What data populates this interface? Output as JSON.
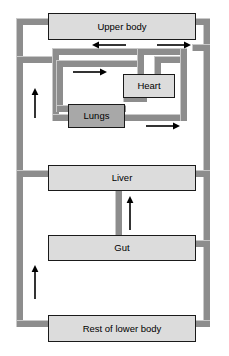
{
  "diagram": {
    "width": 229,
    "height": 356,
    "background": "#ffffff",
    "colors": {
      "vessel": "#8d8d8d",
      "vessel_highlight": "#c9c9c9",
      "organ_fill": "#dcdcdc",
      "organ_shaded_fill": "#a8a8a8",
      "organ_border": "#1a1a1a",
      "arrow": "#000000",
      "text": "#000000"
    }
  },
  "organs": [
    {
      "key": "upper_body",
      "label": "Upper body",
      "shaded": false,
      "x": 48,
      "y": 13,
      "w": 148,
      "h": 27
    },
    {
      "key": "heart",
      "label": "Heart",
      "shaded": false,
      "x": 123,
      "y": 74,
      "w": 52,
      "h": 24
    },
    {
      "key": "lungs",
      "label": "Lungs",
      "shaded": true,
      "x": 68,
      "y": 104,
      "w": 57,
      "h": 24
    },
    {
      "key": "liver",
      "label": "Liver",
      "shaded": false,
      "x": 48,
      "y": 165,
      "w": 148,
      "h": 26
    },
    {
      "key": "gut",
      "label": "Gut",
      "shaded": false,
      "x": 48,
      "y": 235,
      "w": 148,
      "h": 26
    },
    {
      "key": "rest_of_lower_body",
      "label": "Rest of lower body",
      "shaded": false,
      "x": 48,
      "y": 315,
      "w": 148,
      "h": 27
    }
  ],
  "vessels": [
    {
      "key": "left-main-trunk",
      "x": 16,
      "y": 18,
      "w": 7,
      "h": 309
    },
    {
      "key": "left-trunk-to-upper-body",
      "x": 16,
      "y": 18,
      "w": 36,
      "h": 7
    },
    {
      "key": "left-trunk-to-pulmonary",
      "x": 16,
      "y": 56,
      "w": 40,
      "h": 7
    },
    {
      "key": "left-trunk-to-liver",
      "x": 16,
      "y": 170,
      "w": 36,
      "h": 7
    },
    {
      "key": "left-trunk-to-lower-body",
      "x": 16,
      "y": 320,
      "w": 36,
      "h": 7
    },
    {
      "key": "right-main-trunk",
      "x": 203,
      "y": 18,
      "w": 7,
      "h": 309
    },
    {
      "key": "right-trunk-to-upper-body",
      "x": 192,
      "y": 18,
      "w": 18,
      "h": 7
    },
    {
      "key": "right-trunk-to-aortic-arch",
      "x": 192,
      "y": 44,
      "w": 18,
      "h": 7
    },
    {
      "key": "right-trunk-to-liver",
      "x": 192,
      "y": 170,
      "w": 18,
      "h": 7
    },
    {
      "key": "right-trunk-to-gut",
      "x": 192,
      "y": 240,
      "w": 18,
      "h": 7
    },
    {
      "key": "right-trunk-to-lower-body",
      "x": 192,
      "y": 320,
      "w": 18,
      "h": 7
    },
    {
      "key": "pulmonary-outer-top",
      "x": 52,
      "y": 48,
      "w": 135,
      "h": 7
    },
    {
      "key": "pulmonary-outer-left",
      "x": 52,
      "y": 48,
      "w": 7,
      "h": 73
    },
    {
      "key": "pulmonary-outer-bottom",
      "x": 52,
      "y": 114,
      "w": 135,
      "h": 7
    },
    {
      "key": "pulmonary-outer-right",
      "x": 180,
      "y": 48,
      "w": 7,
      "h": 73
    },
    {
      "key": "pulmonary-inner-top",
      "x": 56,
      "y": 60,
      "w": 88,
      "h": 7
    },
    {
      "key": "pulmonary-inner-left",
      "x": 56,
      "y": 60,
      "w": 7,
      "h": 52
    },
    {
      "key": "pulmonary-inner-bottom",
      "x": 56,
      "y": 105,
      "w": 70,
      "h": 7
    },
    {
      "key": "heart-inflow-right",
      "x": 137,
      "y": 48,
      "w": 7,
      "h": 28
    },
    {
      "key": "heart-outflow-left",
      "x": 154,
      "y": 56,
      "w": 7,
      "h": 22
    },
    {
      "key": "heart-outflow-top",
      "x": 154,
      "y": 56,
      "w": 26,
      "h": 7
    },
    {
      "key": "heart-return-bottom",
      "x": 123,
      "y": 95,
      "w": 24,
      "h": 7
    },
    {
      "key": "liver-to-gut",
      "x": 115,
      "y": 189,
      "w": 7,
      "h": 48
    }
  ],
  "arrows": [
    {
      "key": "upper-body-return-arrow",
      "direction": "left",
      "x": 92,
      "y": 40,
      "length": 34
    },
    {
      "key": "upper-body-supply-arrow",
      "direction": "right",
      "x": 157,
      "y": 40,
      "length": 34
    },
    {
      "key": "pulmonary-artery-arrow",
      "direction": "right",
      "x": 73,
      "y": 67,
      "length": 34
    },
    {
      "key": "pulmonary-vein-arrow",
      "direction": "right",
      "x": 146,
      "y": 121,
      "length": 34
    },
    {
      "key": "vena-cava-upper-arrow",
      "direction": "up",
      "x": 30,
      "y": 88,
      "length": 30
    },
    {
      "key": "vena-cava-lower-arrow",
      "direction": "up",
      "x": 30,
      "y": 265,
      "length": 34
    },
    {
      "key": "hepatic-portal-arrow",
      "direction": "up",
      "x": 125,
      "y": 196,
      "length": 34
    }
  ]
}
